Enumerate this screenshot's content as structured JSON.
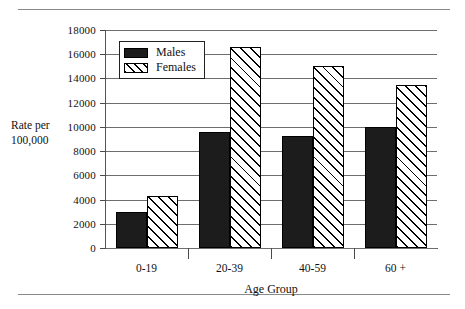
{
  "figure": {
    "has_top_rule": true,
    "has_bottom_rule": true
  },
  "chart_data": {
    "type": "bar",
    "title": "",
    "xlabel": "Age Group",
    "ylabel": "Rate per 100,000",
    "ylabel_line1": "Rate per",
    "ylabel_line2": "100,000",
    "categories": [
      "0-19",
      "20-39",
      "40-59",
      "60 +"
    ],
    "series": [
      {
        "name": "Males",
        "values": [
          2950,
          9600,
          9250,
          10000
        ]
      },
      {
        "name": "Females",
        "values": [
          4300,
          16600,
          15000,
          13500
        ]
      }
    ],
    "ylim": [
      0,
      18000
    ],
    "ytick_values": [
      0,
      2000,
      4000,
      6000,
      8000,
      10000,
      12000,
      14000,
      16000,
      18000
    ],
    "ytick_labels": [
      "0",
      "2000",
      "4000",
      "6000",
      "8000",
      "10000",
      "12000",
      "14000",
      "16000",
      "18000"
    ],
    "grid": true,
    "grid_axis": "y",
    "legend_position": "upper-left-inside",
    "colors": {
      "males": "#1c1c1c",
      "females": "#ffffff",
      "females_hatch": "#000000",
      "gridline": "#6e6e6e",
      "axis": "#555555",
      "text": "#111111",
      "background": "#ffffff"
    }
  },
  "legend": {
    "entries": [
      {
        "label": "Males",
        "style": "solid-black-swatch"
      },
      {
        "label": "Females",
        "style": "diagonal-hatch-swatch"
      }
    ]
  }
}
